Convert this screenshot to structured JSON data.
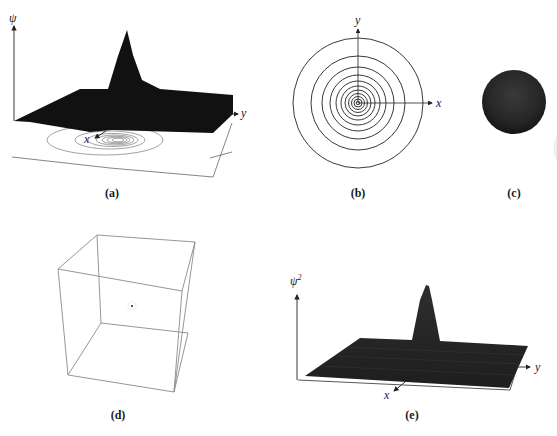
{
  "panels": {
    "a": {
      "caption": "(a)",
      "axis_z": "ψ",
      "axis_x": "x",
      "axis_y": "y",
      "description": "3D surface of wavefunction with contour projection"
    },
    "b": {
      "caption": "(b)",
      "axis_x": "x",
      "axis_y": "y",
      "description": "Concentric circular contour plot"
    },
    "c": {
      "caption": "(c)",
      "description": "Dark shaded sphere"
    },
    "d": {
      "caption": "(d)",
      "description": "Wireframe cube with point cloud at center"
    },
    "e": {
      "caption": "(e)",
      "axis_z": "ψ",
      "axis_z_sup": "2",
      "axis_x": "x",
      "axis_y": "y",
      "description": "3D surface of probability density"
    }
  },
  "colors": {
    "surface": "#1c1c1c",
    "line": "#333333",
    "light_line": "#8a8a8a",
    "sphere": "#2a2a2a"
  }
}
